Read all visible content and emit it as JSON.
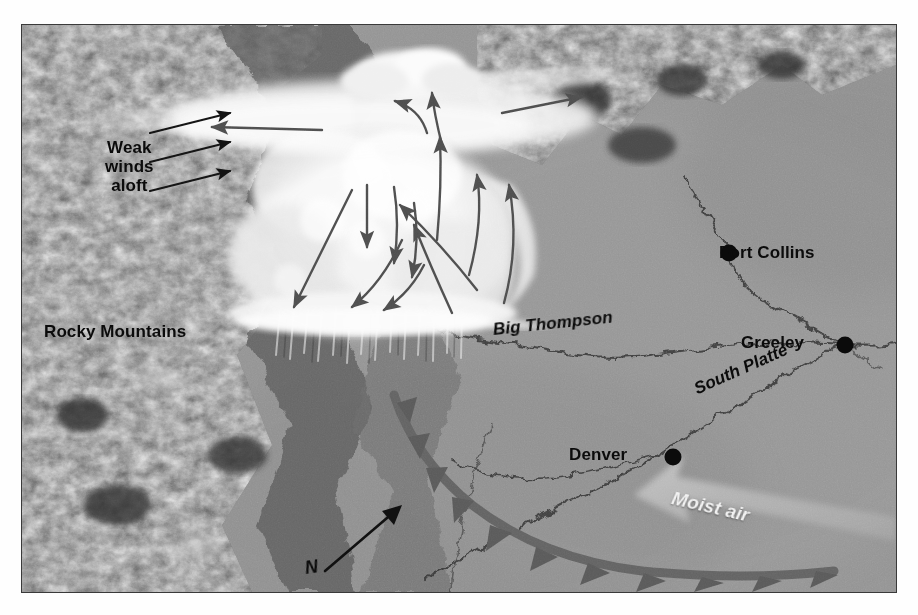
{
  "figure": {
    "type": "schematic-map-photo",
    "palette": {
      "plains_gray": "#909090",
      "mountain_dark": "#4a4a4a",
      "cloud_white": "#f4f4f4",
      "arrow_gray": "#4e4e4e",
      "front_gray": "#636363",
      "label_black": "#0b0b0b",
      "label_white": "#f2f2f2",
      "border": "#3a3a3a",
      "page_background": "#fefefe"
    },
    "annotations": [
      {
        "id": "weak-winds-aloft",
        "text": "Weak\nwinds\naloft",
        "line1": "Weak",
        "line2": "winds",
        "line3": "aloft",
        "x": 83,
        "y": 113,
        "size": 17,
        "style": "upright",
        "color": "#0b0b0b"
      },
      {
        "id": "rocky-mountains",
        "text": "Rocky Mountains",
        "x": 44,
        "y": 308,
        "size": 17,
        "style": "upright",
        "color": "#0b0b0b"
      },
      {
        "id": "fort-collins",
        "text": "Fort Collins",
        "x": 719,
        "y": 222,
        "size": 17,
        "style": "upright",
        "color": "#0b0b0b"
      },
      {
        "id": "greeley",
        "text": "Greeley",
        "x": 741,
        "y": 308,
        "size": 17,
        "style": "upright",
        "color": "#0b0b0b"
      },
      {
        "id": "denver",
        "text": "Denver",
        "x": 569,
        "y": 420,
        "size": 17,
        "style": "upright",
        "color": "#0b0b0b"
      },
      {
        "id": "big-thompson",
        "text": "Big Thompson",
        "x": 493,
        "y": 305,
        "size": 17,
        "style": "italic",
        "rotation": -6,
        "color": "#0b0b0b"
      },
      {
        "id": "south-platte",
        "text": "South Platte",
        "x": 695,
        "y": 362,
        "size": 17,
        "style": "italic",
        "rotation": -24,
        "color": "#0b0b0b"
      },
      {
        "id": "moist-air",
        "text": "Moist air",
        "x": 672,
        "y": 470,
        "size": 19,
        "style": "italic",
        "rotation": 13,
        "color": "#f2f2f2"
      },
      {
        "id": "north-arrow-letter",
        "text": "N",
        "x": 305,
        "y": 545,
        "size": 18,
        "style": "italic",
        "color": "#0b0b0b"
      }
    ],
    "cities": [
      {
        "name": "Fort Collins",
        "dot_x": 707,
        "dot_y": 228,
        "label_side": "right"
      },
      {
        "name": "Greeley",
        "dot_x": 823,
        "dot_y": 320,
        "label_side": "left"
      },
      {
        "name": "Denver",
        "dot_x": 651,
        "dot_y": 432,
        "label_side": "left"
      }
    ],
    "rivers": [
      {
        "name": "Cache la Poudre",
        "labeled": false
      },
      {
        "name": "Big Thompson",
        "labeled": true
      },
      {
        "name": "South Platte",
        "labeled": true
      }
    ],
    "features": [
      {
        "id": "rocky-mountains",
        "kind": "terrain",
        "description": "rugged dark forested mountain block along the left and upper-left of the frame"
      },
      {
        "id": "great-plains",
        "kind": "terrain",
        "description": "smooth mid-gray plains filling the right and lower portion of the frame"
      },
      {
        "id": "thunderstorm-cloud",
        "kind": "cloud",
        "description": "bright white cumulonimbus with a flat spreading anvil top"
      },
      {
        "id": "anvil-outflow",
        "kind": "cloud",
        "description": "thin bright anvil streaming left and right from the storm top"
      },
      {
        "id": "precipitation-shaft",
        "kind": "precipitation",
        "description": "vertical streaks of rain falling from the cloud base onto the foothills"
      },
      {
        "id": "cold-front",
        "kind": "front",
        "description": "dark gray curved cold-front line with solid triangular barbs arcing across the plains"
      },
      {
        "id": "north-arrow",
        "kind": "compass",
        "description": "black arrow pointing up and to the right labeled N"
      }
    ],
    "flow_arrows": [
      {
        "id": "weak-wind-arrow-1",
        "role": "ambient wind aloft",
        "direction": "up-right"
      },
      {
        "id": "weak-wind-arrow-2",
        "role": "ambient wind aloft",
        "direction": "up-right"
      },
      {
        "id": "weak-wind-arrow-3",
        "role": "ambient wind aloft",
        "direction": "up-right"
      },
      {
        "id": "anvil-outflow-left",
        "role": "anvil outflow",
        "direction": "left"
      },
      {
        "id": "anvil-outflow-right",
        "role": "anvil outflow",
        "direction": "right"
      },
      {
        "id": "updraft-core-1",
        "role": "updraft",
        "direction": "up"
      },
      {
        "id": "updraft-core-2",
        "role": "updraft",
        "direction": "up"
      },
      {
        "id": "updraft-core-3",
        "role": "updraft",
        "direction": "up"
      },
      {
        "id": "inflow-curving-1",
        "role": "low-level inflow turning into updraft",
        "direction": "up-left curving"
      },
      {
        "id": "inflow-curving-2",
        "role": "low-level inflow turning into updraft",
        "direction": "up-left curving"
      },
      {
        "id": "downdraft-1",
        "role": "downdraft",
        "direction": "down"
      },
      {
        "id": "downdraft-2",
        "role": "downdraft",
        "direction": "down"
      },
      {
        "id": "downdraft-outflow",
        "role": "spreading surface outflow",
        "direction": "down-left curving"
      },
      {
        "id": "moist-air-inflow",
        "role": "moist low-level inflow from the southeast",
        "direction": "up-left curving"
      }
    ]
  }
}
